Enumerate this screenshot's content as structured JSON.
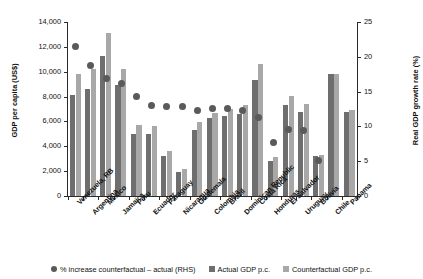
{
  "chart_data": {
    "type": "bar",
    "title": "",
    "xlabel": "",
    "ylabel": "GDP per capita (US$)",
    "y2label": "Real GDP growth rate (%)",
    "ylim": [
      0,
      14000
    ],
    "y2lim": [
      0,
      25
    ],
    "yticks": [
      "0",
      "2,000",
      "4,000",
      "6,000",
      "8,000",
      "10,000",
      "12,000",
      "14,000"
    ],
    "ytick_values": [
      0,
      2000,
      4000,
      6000,
      8000,
      10000,
      12000,
      14000
    ],
    "y2ticks": [
      "0",
      "5",
      "10",
      "15",
      "20",
      "25"
    ],
    "y2tick_values": [
      0,
      5,
      10,
      15,
      20,
      25
    ],
    "grid": false,
    "legend_position": "bottom",
    "categories": [
      "Venezuela, RB",
      "Argentina",
      "Mexico",
      "Jamaica",
      "Peru",
      "Ecuador",
      "Paraguay",
      "Nicaragua",
      "Guatemala",
      "Colombia",
      "Brazil",
      "Dominican Republic",
      "Costa Rica",
      "Honduras",
      "El Salvador",
      "Uruguay",
      "Bolivia",
      "Chile",
      "Panama"
    ],
    "series": [
      {
        "name": "Actual GDP p.c.",
        "axis": "left",
        "color": "#6e6e6e",
        "values": [
          8100,
          8650,
          11250,
          8950,
          5000,
          5000,
          3250,
          1950,
          5300,
          6250,
          6450,
          6600,
          9300,
          2850,
          7350,
          6800,
          3200,
          9800,
          6800
        ]
      },
      {
        "name": "Counterfactual GDP p.c.",
        "axis": "left",
        "color": "#a8a8a8",
        "values": [
          9850,
          10200,
          13100,
          10250,
          5700,
          5650,
          3650,
          2200,
          5950,
          6700,
          7000,
          7350,
          10600,
          3150,
          8050,
          7400,
          3300,
          9800,
          6900
        ]
      },
      {
        "name": "% increase counterfactual – actual (RHS)",
        "axis": "right",
        "color": "#5a5a5a",
        "type": "scatter",
        "values": [
          21.5,
          18.8,
          16.9,
          16.1,
          14.3,
          13.0,
          12.8,
          12.8,
          12.3,
          12.6,
          12.6,
          12.3,
          11.3,
          7.7,
          9.6,
          9.4,
          5.1,
          null,
          null
        ]
      }
    ]
  },
  "legend": {
    "items": [
      {
        "marker": "dot",
        "label": "% increase counterfactual – actual (RHS)"
      },
      {
        "marker": "square-actual",
        "label": "Actual GDP p.c."
      },
      {
        "marker": "square-counter",
        "label": "Counterfactual GDP p.c."
      }
    ]
  }
}
